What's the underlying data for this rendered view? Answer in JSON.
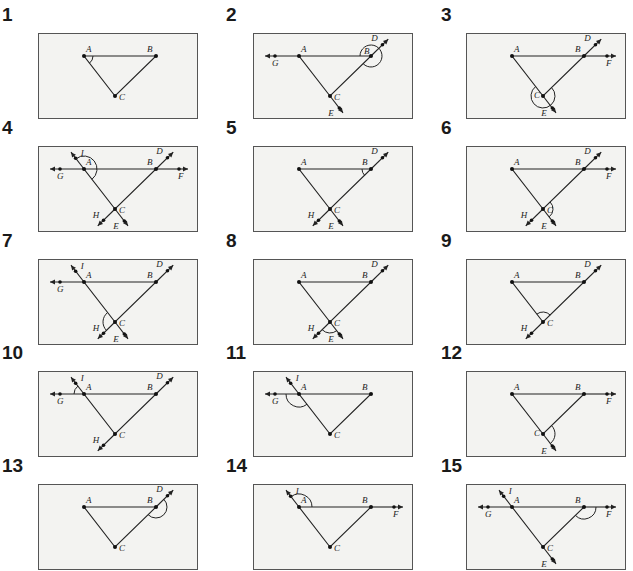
{
  "colors": {
    "panel_bg": "#f3f3f1",
    "border": "#555555",
    "line": "#222222",
    "text": "#1a1a1a"
  },
  "points": {
    "A": [
      45,
      22
    ],
    "B": [
      117,
      22
    ],
    "C": [
      76,
      62
    ]
  },
  "panels": [
    {
      "number": "1",
      "rays": [],
      "labels": [
        "A",
        "B",
        "C"
      ],
      "angle": "BAC (at A, interior)"
    },
    {
      "number": "2",
      "rays": [
        "G",
        "D",
        "E"
      ],
      "labels": [
        "A",
        "B",
        "C",
        "D",
        "E",
        "G"
      ],
      "angle": "ABC + reflex at B"
    },
    {
      "number": "3",
      "rays": [
        "D",
        "F",
        "E"
      ],
      "labels": [
        "A",
        "B",
        "C",
        "D",
        "E",
        "F"
      ],
      "angle": "reflex at C"
    },
    {
      "number": "4",
      "rays": [
        "I",
        "G",
        "D",
        "F",
        "H",
        "E"
      ],
      "labels": [
        "A",
        "B",
        "C",
        "D",
        "E",
        "F",
        "G",
        "H",
        "I"
      ],
      "angle": "IAB (at A)"
    },
    {
      "number": "5",
      "rays": [
        "D",
        "H",
        "E"
      ],
      "labels": [
        "A",
        "B",
        "C",
        "D",
        "E",
        "H"
      ],
      "angle": "ABC (at B)"
    },
    {
      "number": "6",
      "rays": [
        "D",
        "F",
        "H",
        "E"
      ],
      "labels": [
        "A",
        "B",
        "C",
        "D",
        "E",
        "F",
        "H"
      ],
      "angle": "BCE (at C)"
    },
    {
      "number": "7",
      "rays": [
        "I",
        "G",
        "D",
        "H",
        "E"
      ],
      "labels": [
        "A",
        "B",
        "C",
        "D",
        "E",
        "G",
        "H",
        "I"
      ],
      "angle": "ACH (at C)"
    },
    {
      "number": "8",
      "rays": [
        "D",
        "H",
        "E"
      ],
      "labels": [
        "A",
        "B",
        "C",
        "D",
        "E",
        "H"
      ],
      "angle": "HCE (at C)"
    },
    {
      "number": "9",
      "rays": [
        "D",
        "H"
      ],
      "labels": [
        "A",
        "B",
        "C",
        "D",
        "H"
      ],
      "angle": "ACB (at C)"
    },
    {
      "number": "10",
      "rays": [
        "I",
        "G",
        "D",
        "H"
      ],
      "labels": [
        "A",
        "B",
        "C",
        "D",
        "G",
        "H",
        "I"
      ],
      "angle": "GAI (at A)"
    },
    {
      "number": "11",
      "rays": [
        "I",
        "G"
      ],
      "labels": [
        "A",
        "B",
        "C",
        "G",
        "I"
      ],
      "angle": "GAC (at A)"
    },
    {
      "number": "12",
      "rays": [
        "F",
        "E"
      ],
      "labels": [
        "A",
        "B",
        "C",
        "E",
        "F"
      ],
      "angle": "reflex BCE (at C)"
    },
    {
      "number": "13",
      "rays": [
        "D"
      ],
      "labels": [
        "A",
        "B",
        "C",
        "D"
      ],
      "angle": "DBC (at B)"
    },
    {
      "number": "14",
      "rays": [
        "I",
        "F"
      ],
      "labels": [
        "A",
        "B",
        "C",
        "F",
        "I"
      ],
      "angle": "IAB (at A)"
    },
    {
      "number": "15",
      "rays": [
        "I",
        "G",
        "F",
        "E"
      ],
      "labels": [
        "A",
        "B",
        "C",
        "E",
        "F",
        "G",
        "I"
      ],
      "angle": "CBF (at B)"
    }
  ]
}
